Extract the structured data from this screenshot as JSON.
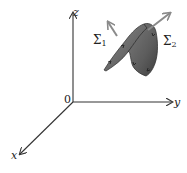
{
  "diagram": {
    "axes": {
      "origin_label": "0",
      "x_label": "x",
      "y_label": "y",
      "z_label": "z"
    },
    "surfaces": [
      {
        "symbol": "Σ",
        "subscript": "1"
      },
      {
        "symbol": "Σ",
        "subscript": "2"
      }
    ],
    "colors": {
      "axis": "#333333",
      "surface_fill": "#6e6e6e",
      "surface_dark": "#4a4a4a",
      "normal_arrow": "#8a8a8a"
    }
  }
}
